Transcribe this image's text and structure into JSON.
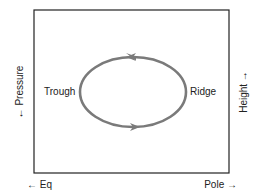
{
  "diagram": {
    "labels": {
      "trough": "Trough",
      "ridge": "Ridge",
      "left_axis": "← Pressure",
      "right_axis": "Height →",
      "bottom_left": "← Eq",
      "bottom_right": "Pole →"
    },
    "circulation": {
      "direction": "counterclockwise",
      "color": "#7a7a7a"
    }
  }
}
